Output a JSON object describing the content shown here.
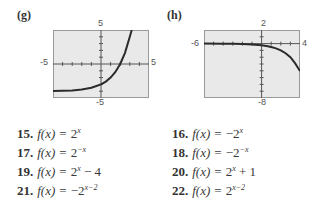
{
  "graphs": [
    {
      "label": "(g)",
      "xmin_label": "-5",
      "xmax_label": "5",
      "ymax_label": "5",
      "ymin_label": "-5",
      "xmin": -5,
      "xmax": 5,
      "ymin": -5,
      "ymax": 5,
      "function": "2^x - 4"
    },
    {
      "label": "(h)",
      "xmin_label": "-6",
      "xmax_label": "4",
      "ymax_label": "2",
      "ymin_label": "-8",
      "xmin": -6,
      "xmax": 4,
      "ymin": -8,
      "ymax": 2,
      "function": "-2^(x-2)"
    }
  ],
  "colors": {
    "plot_background": "#e9e9e9",
    "plot_border": "#9a9a9a",
    "curve": "#2b2b2b",
    "axis": "#555555"
  },
  "exercises": [
    {
      "num": "15.",
      "fx": "f(x)",
      "eq": "=",
      "base": "2",
      "exp": "x",
      "tail": ""
    },
    {
      "num": "16.",
      "fx": "f(x)",
      "eq": "=",
      "base": "−2",
      "exp": "x",
      "tail": ""
    },
    {
      "num": "17.",
      "fx": "f(x)",
      "eq": "=",
      "base": "2",
      "exp": "−x",
      "tail": ""
    },
    {
      "num": "18.",
      "fx": "f(x)",
      "eq": "=",
      "base": "−2",
      "exp": "−x",
      "tail": ""
    },
    {
      "num": "19.",
      "fx": "f(x)",
      "eq": "=",
      "base": "2",
      "exp": "x",
      "tail": " − 4"
    },
    {
      "num": "20.",
      "fx": "f(x)",
      "eq": "=",
      "base": "2",
      "exp": "x",
      "tail": " + 1"
    },
    {
      "num": "21.",
      "fx": "f(x)",
      "eq": "=",
      "base": "−2",
      "exp": "x−2",
      "tail": ""
    },
    {
      "num": "22.",
      "fx": "f(x)",
      "eq": "=",
      "base": "2",
      "exp": "x−2",
      "tail": ""
    }
  ]
}
